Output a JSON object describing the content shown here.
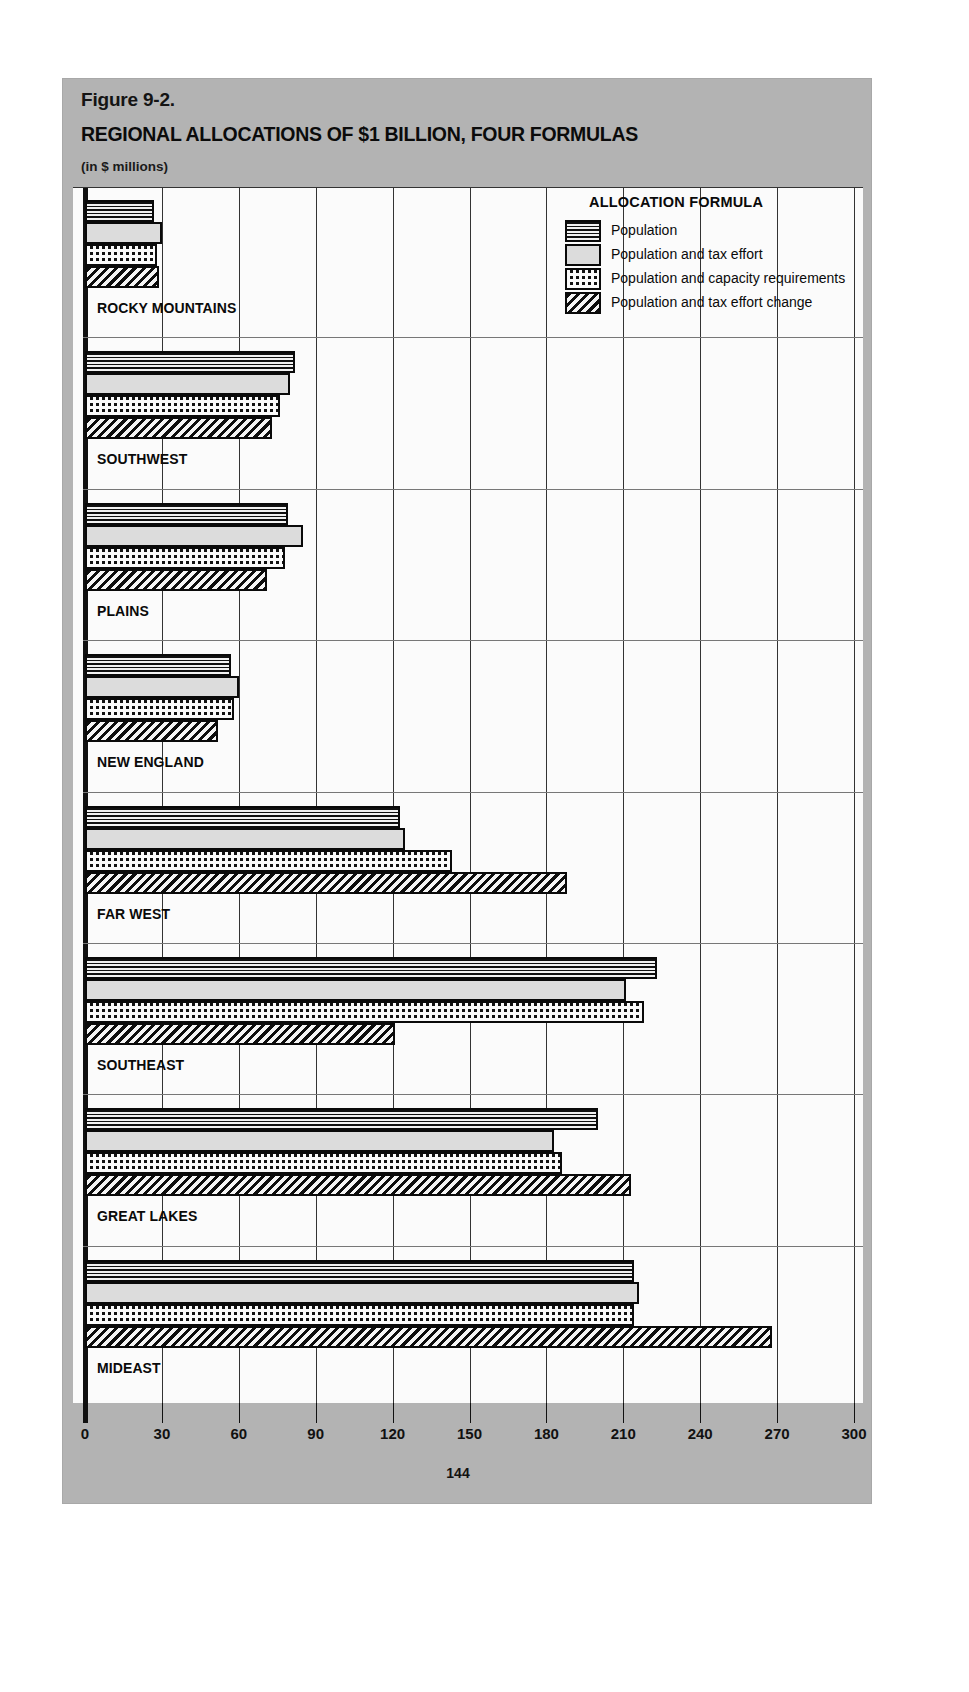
{
  "figure": {
    "label": "Figure 9-2.",
    "title": "REGIONAL ALLOCATIONS OF $1 BILLION, FOUR FORMULAS",
    "units": "(in $ millions)",
    "page_number": "144"
  },
  "legend": {
    "title": "ALLOCATION FORMULA",
    "entries": [
      {
        "label": "Population",
        "pattern": "horizontal-lines"
      },
      {
        "label": "Population and tax effort",
        "pattern": "solid-light-gray"
      },
      {
        "label": "Population and capacity requirements",
        "pattern": "checkerboard"
      },
      {
        "label": "Population and tax effort change",
        "pattern": "diagonal-hatch"
      }
    ]
  },
  "axis": {
    "ticks": [
      "0",
      "30",
      "60",
      "90",
      "120",
      "150",
      "180",
      "210",
      "240",
      "270",
      "300"
    ]
  },
  "chart_data": {
    "type": "bar",
    "orientation": "horizontal",
    "title": "REGIONAL ALLOCATIONS OF $1 BILLION, FOUR FORMULAS",
    "subtitle": "Figure 9-2.",
    "xlabel": "(in $ millions)",
    "ylabel": "",
    "xlim": [
      0,
      300
    ],
    "xticks": [
      0,
      30,
      60,
      90,
      120,
      150,
      180,
      210,
      240,
      270,
      300
    ],
    "grid": true,
    "legend_position": "top-right",
    "categories": [
      "ROCKY MOUNTAINS",
      "SOUTHWEST",
      "PLAINS",
      "NEW ENGLAND",
      "FAR WEST",
      "SOUTHEAST",
      "GREAT LAKES",
      "MIDEAST"
    ],
    "series": [
      {
        "name": "Population",
        "pattern": "horizontal-lines",
        "values": [
          27,
          82,
          79,
          57,
          123,
          223,
          200,
          214
        ]
      },
      {
        "name": "Population and tax effort",
        "pattern": "solid-light-gray",
        "values": [
          30,
          80,
          85,
          60,
          125,
          211,
          183,
          216
        ]
      },
      {
        "name": "Population and capacity requirements",
        "pattern": "checkerboard",
        "values": [
          28,
          76,
          78,
          58,
          143,
          218,
          186,
          214
        ]
      },
      {
        "name": "Population and tax effort change",
        "pattern": "diagonal-hatch",
        "values": [
          29,
          73,
          71,
          52,
          188,
          121,
          213,
          268
        ]
      }
    ]
  }
}
